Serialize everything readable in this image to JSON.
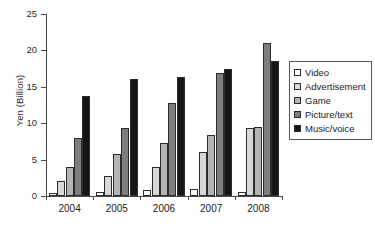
{
  "chart_data": {
    "type": "bar",
    "title": "",
    "xlabel": "",
    "ylabel": "Yen (Billion)",
    "categories": [
      "2004",
      "2005",
      "2006",
      "2007",
      "2008"
    ],
    "ylim": [
      0,
      25
    ],
    "yticks": [
      0,
      5,
      10,
      15,
      20,
      25
    ],
    "grid": false,
    "legend_position": "right",
    "series": [
      {
        "name": "Video",
        "swatch_class": "sw-video",
        "color": "#ffffff",
        "values": [
          0.4,
          0.5,
          0.8,
          1.0,
          0.6
        ]
      },
      {
        "name": "Advertisement",
        "swatch_class": "sw-advertisement",
        "color": "#d8d8d8",
        "values": [
          2.0,
          2.8,
          4.0,
          6.1,
          9.3
        ]
      },
      {
        "name": "Game",
        "swatch_class": "sw-game",
        "color": "#b4b4b4",
        "values": [
          4.0,
          5.8,
          7.3,
          8.4,
          9.5
        ]
      },
      {
        "name": "Picture/text",
        "swatch_class": "sw-picturetext",
        "color": "#7e7e7e",
        "values": [
          8.0,
          9.3,
          12.8,
          16.9,
          21.0
        ]
      },
      {
        "name": "Music/voice",
        "swatch_class": "sw-musicvoice",
        "color": "#151515",
        "values": [
          13.8,
          16.1,
          16.3,
          17.5,
          18.6
        ]
      }
    ]
  }
}
